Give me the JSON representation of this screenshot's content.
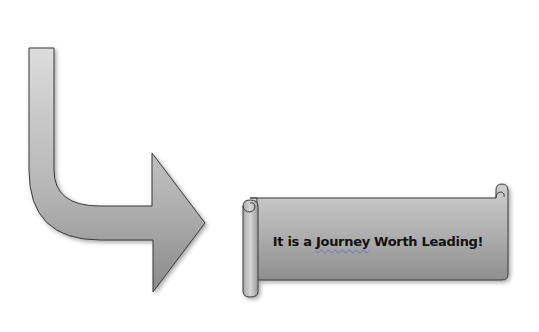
{
  "diagram": {
    "arrow": {
      "shape": "bent-down-right-arrow",
      "fill_top": "#d4d4d4",
      "fill_bottom": "#909090",
      "stroke": "#3a3a3a"
    },
    "banner": {
      "shape": "horizontal-scroll",
      "text_before": "It is a ",
      "text_flagged": "Journey",
      "text_after": " Worth Leading!",
      "fill_top": "#c8c8c8",
      "fill_bottom": "#8f8f8f",
      "stroke": "#3a3a3a"
    }
  }
}
